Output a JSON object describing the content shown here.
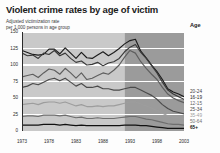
{
  "title": "Violent crime rates by age of victim",
  "subtitle_line1": "Adjusted victimization rate",
  "subtitle_line2": "per 1,000 persons in age group",
  "legend_header": "Age",
  "axes": {
    "y_ticks": [
      "150",
      "125",
      "100",
      "75",
      "50",
      "25",
      "0"
    ],
    "x_ticks": [
      "1973",
      "1978",
      "1983",
      "1988",
      "1993",
      "1998",
      "2003"
    ]
  },
  "legend": [
    {
      "label": "20-24",
      "color": "#3a3a3a",
      "bold": false
    },
    {
      "label": "16-19",
      "color": "#1c1c1c",
      "bold": false
    },
    {
      "label": "12-15",
      "color": "#5e5e5e",
      "bold": false
    },
    {
      "label": "25-34",
      "color": "#4a4a4a",
      "bold": false
    },
    {
      "label": "35-49",
      "color": "#9d9d9d",
      "bold": false
    },
    {
      "label": "50-64",
      "color": "#6e6e6e",
      "bold": false
    },
    {
      "label": "65+",
      "color": "#111111",
      "bold": true
    }
  ],
  "chart_data": {
    "type": "line",
    "title": "Violent crime rates by age of victim",
    "subtitle": "Adjusted victimization rate per 1,000 persons in age group",
    "xlabel": "",
    "ylabel": "Adjusted victimization rate per 1,000 persons in age group",
    "xlim": [
      1973,
      2003
    ],
    "ylim": [
      0,
      150
    ],
    "y_ticks": [
      0,
      25,
      50,
      75,
      100,
      125,
      150
    ],
    "x_ticks": [
      1973,
      1978,
      1983,
      1988,
      1993,
      1998,
      2003
    ],
    "grid": "horizontal-white",
    "legend_position": "right",
    "legend_title": "Age",
    "shaded_bands": [
      {
        "from": 1973,
        "to": 1992,
        "shade": "#c9c9c9",
        "note": "lighter background band"
      },
      {
        "from": 1992,
        "to": 2003,
        "shade": "#9b9b9b",
        "note": "darker background band"
      }
    ],
    "x": [
      1973,
      1974,
      1975,
      1976,
      1977,
      1978,
      1979,
      1980,
      1981,
      1982,
      1983,
      1984,
      1985,
      1986,
      1987,
      1988,
      1989,
      1990,
      1991,
      1992,
      1993,
      1994,
      1995,
      1996,
      1997,
      1998,
      1999,
      2000,
      2001,
      2002,
      2003
    ],
    "series": [
      {
        "name": "16-19",
        "color": "#1c1c1c",
        "values": [
          122,
          119,
          116,
          115,
          116,
          124,
          124,
          117,
          126,
          118,
          110,
          119,
          111,
          110,
          115,
          120,
          114,
          119,
          125,
          132,
          137,
          139,
          121,
          111,
          100,
          90,
          78,
          64,
          59,
          56,
          52
        ]
      },
      {
        "name": "20-24",
        "color": "#3a3a3a",
        "values": [
          118,
          114,
          115,
          110,
          118,
          116,
          122,
          114,
          118,
          110,
          104,
          106,
          100,
          101,
          104,
          99,
          103,
          105,
          110,
          120,
          127,
          131,
          119,
          110,
          99,
          88,
          74,
          62,
          56,
          52,
          48
        ]
      },
      {
        "name": "12-15",
        "color": "#5e5e5e",
        "values": [
          82,
          84,
          86,
          81,
          88,
          94,
          92,
          86,
          95,
          88,
          80,
          88,
          78,
          80,
          84,
          88,
          86,
          92,
          100,
          112,
          122,
          118,
          105,
          95,
          86,
          78,
          66,
          56,
          50,
          46,
          43
        ]
      },
      {
        "name": "25-34",
        "color": "#4a4a4a",
        "values": [
          66,
          68,
          72,
          70,
          74,
          78,
          80,
          76,
          80,
          74,
          68,
          72,
          66,
          66,
          68,
          64,
          64,
          62,
          62,
          64,
          66,
          66,
          62,
          58,
          54,
          48,
          40,
          34,
          30,
          28,
          26
        ]
      },
      {
        "name": "35-49",
        "color": "#9d9d9d",
        "values": [
          40,
          41,
          42,
          40,
          43,
          44,
          44,
          42,
          44,
          41,
          38,
          40,
          37,
          37,
          38,
          37,
          38,
          38,
          40,
          42,
          44,
          44,
          41,
          38,
          35,
          31,
          27,
          23,
          21,
          20,
          19
        ]
      },
      {
        "name": "50-64",
        "color": "#6e6e6e",
        "values": [
          22,
          23,
          23,
          22,
          24,
          24,
          24,
          23,
          24,
          22,
          20,
          21,
          19,
          19,
          20,
          19,
          19,
          19,
          20,
          21,
          22,
          22,
          20,
          18,
          17,
          15,
          13,
          11,
          10,
          10,
          9
        ]
      },
      {
        "name": "65+",
        "color": "#111111",
        "values": [
          9,
          9,
          9,
          9,
          10,
          10,
          10,
          9,
          10,
          9,
          8,
          9,
          8,
          8,
          8,
          8,
          8,
          8,
          8,
          9,
          9,
          9,
          8,
          8,
          7,
          6,
          5,
          4,
          4,
          4,
          4
        ]
      }
    ]
  }
}
